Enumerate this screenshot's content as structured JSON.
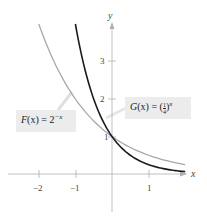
{
  "chart_data": {
    "type": "line",
    "title": "",
    "xlabel": "x",
    "ylabel": "y",
    "xlim": [
      -2.5,
      2.0
    ],
    "ylim": [
      -1.2,
      4.2
    ],
    "x_ticks": [
      -2,
      -1,
      1
    ],
    "x_tick_labels": [
      "−2",
      "−1",
      "1"
    ],
    "y_ticks": [
      1,
      2,
      3
    ],
    "y_tick_labels": [
      "1",
      "2",
      "3"
    ],
    "grid": false,
    "series": [
      {
        "name": "F(x) = 2^(−x)",
        "color": "#a8a8a8",
        "x": [
          -2,
          -1.5,
          -1,
          -0.5,
          0,
          0.5,
          1,
          1.5,
          2
        ],
        "y": [
          4,
          2.83,
          2,
          1.41,
          1,
          0.71,
          0.5,
          0.35,
          0.25
        ]
      },
      {
        "name": "G(x) = (1/4)^x",
        "color": "#1a1a1a",
        "x": [
          -1,
          -0.75,
          -0.5,
          -0.25,
          0,
          0.5,
          1,
          1.5,
          2
        ],
        "y": [
          4,
          2.83,
          2,
          1.41,
          1,
          0.5,
          0.25,
          0.125,
          0.0625
        ]
      }
    ],
    "annotations": [
      {
        "text": "F(x) = 2^(−x)",
        "target_series": 0
      },
      {
        "text": "G(x) = (1/4)^x",
        "target_series": 1
      }
    ]
  },
  "labels": {
    "x_axis": "x",
    "y_axis": "y",
    "ticks_x": [
      "−2",
      "−1",
      "1"
    ],
    "ticks_y": [
      "3",
      "2",
      "1"
    ],
    "f_name": "F",
    "f_arg": "(x)",
    "f_eq": " = 2",
    "f_exp": "−x",
    "g_name": "G",
    "g_arg": "(x)",
    "g_eq": " = (",
    "g_num": "1",
    "g_den": "4",
    "g_close": ")",
    "g_exp": "x"
  },
  "colors": {
    "f_curve": "#a8a8a8",
    "g_curve": "#1a1a1a",
    "axis": "#b0b0b0",
    "label_bg": "#ececec"
  }
}
